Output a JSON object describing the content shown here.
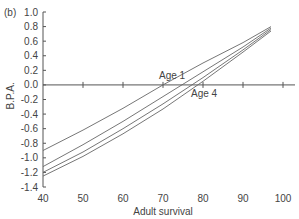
{
  "panel_label": "(b)",
  "chart_data": {
    "type": "line",
    "title": "",
    "xlabel": "Adult survival",
    "ylabel": "B.P.A.",
    "xlim": [
      40,
      100
    ],
    "ylim": [
      -1.4,
      1.0
    ],
    "xticks": [
      40,
      50,
      60,
      70,
      80,
      90,
      100
    ],
    "yticks": [
      1.0,
      0.8,
      0.6,
      0.4,
      0.2,
      0.0,
      -0.2,
      -0.4,
      -0.6,
      -0.8,
      -1.0,
      -1.2,
      -1.4
    ],
    "ytick_labels": [
      "1.0",
      "0.8",
      "0.6",
      "0.4",
      "0.2",
      "0.0",
      "-0.2",
      "-0.4",
      "-0.6",
      "-0.8",
      "-1.0",
      "-1.2",
      "-1.4"
    ],
    "grid": false,
    "legend": "inline annotations",
    "series": [
      {
        "name": "Age 1",
        "x": [
          40,
          50,
          60,
          70,
          80,
          90,
          97
        ],
        "values": [
          -0.9,
          -0.62,
          -0.32,
          0.0,
          0.3,
          0.58,
          0.8
        ]
      },
      {
        "name": "Age 2",
        "x": [
          40,
          50,
          60,
          70,
          80,
          90,
          97
        ],
        "values": [
          -1.12,
          -0.82,
          -0.5,
          -0.16,
          0.18,
          0.52,
          0.78
        ]
      },
      {
        "name": "Age 3",
        "x": [
          40,
          50,
          60,
          70,
          80,
          90,
          97
        ],
        "values": [
          -1.2,
          -0.92,
          -0.6,
          -0.26,
          0.1,
          0.48,
          0.76
        ]
      },
      {
        "name": "Age 4",
        "x": [
          40,
          50,
          60,
          70,
          80,
          90,
          97
        ],
        "values": [
          -1.25,
          -0.98,
          -0.67,
          -0.33,
          0.05,
          0.45,
          0.74
        ]
      }
    ],
    "annotations": [
      {
        "text": "Age 1",
        "x": 69,
        "y": 0.12
      },
      {
        "text": "Age 4",
        "x": 77,
        "y": -0.12
      }
    ]
  }
}
